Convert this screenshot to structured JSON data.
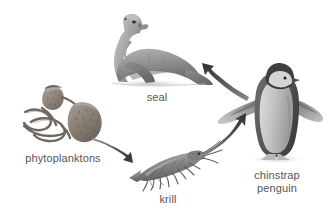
{
  "diagram": {
    "type": "food-chain",
    "background_color": "#ffffff",
    "label_color": "#565656",
    "organisms": [
      {
        "id": "seal",
        "label": "seal",
        "icon": "seal-icon",
        "trophic_level": 4,
        "label_x": 157,
        "label_y": 91
      },
      {
        "id": "phytoplanktons",
        "label": "phytoplanktons",
        "icon": "phytoplankton-icon",
        "trophic_level": 1,
        "label_x": 63,
        "label_y": 152
      },
      {
        "id": "krill",
        "label": "krill",
        "icon": "krill-icon",
        "trophic_level": 2,
        "label_x": 168,
        "label_y": 193
      },
      {
        "id": "chinstrap_penguin",
        "label": "chinstrap penguin",
        "label_line1": "chinstrap",
        "label_line2": "penguin",
        "icon": "penguin-icon",
        "trophic_level": 3,
        "label_x": 277,
        "label_y": 169
      }
    ],
    "arrows": [
      {
        "id": "arrow-phytoplanktons-krill",
        "from": "phytoplanktons",
        "to": "krill",
        "direction": "down-right"
      },
      {
        "id": "arrow-krill-penguin",
        "from": "krill",
        "to": "chinstrap_penguin",
        "direction": "up-right"
      },
      {
        "id": "arrow-penguin-seal",
        "from": "chinstrap_penguin",
        "to": "seal",
        "direction": "up-left"
      }
    ]
  }
}
